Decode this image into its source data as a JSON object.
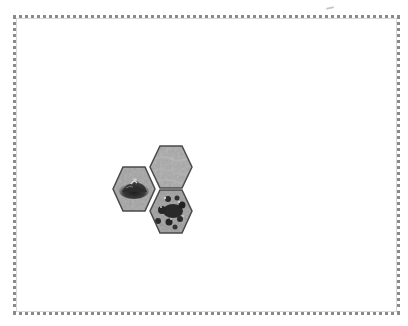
{
  "board": {
    "name": "hex-map-board",
    "border_color": "#8a8a8a",
    "background": "#ffffff"
  },
  "tiles": [
    {
      "id": "tile-plains",
      "terrain": "plains",
      "icon": "plains-tile-icon",
      "x": 149,
      "y": 145,
      "base_color": "#a9a9a9"
    },
    {
      "id": "tile-hill",
      "terrain": "hill",
      "icon": "hill-tile-icon",
      "x": 112,
      "y": 166,
      "base_color": "#a4a4a4"
    },
    {
      "id": "tile-forest",
      "terrain": "forest",
      "icon": "forest-tile-icon",
      "x": 149,
      "y": 189,
      "base_color": "#9c9c9c"
    }
  ],
  "colors": {
    "hex_outline": "#4a4a4a",
    "dark_feature": "#2a2a2a"
  }
}
